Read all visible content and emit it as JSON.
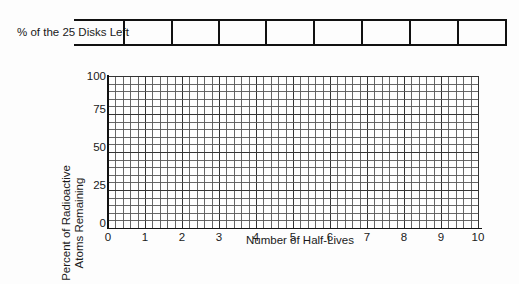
{
  "table": {
    "row_label": "% of the 25 Disks Left",
    "cells": [
      "",
      "",
      "",
      "",
      "",
      "",
      "",
      ""
    ]
  },
  "chart_data": {
    "type": "line",
    "title": "",
    "xlabel": "Number of Half-Lives",
    "ylabel": "Percent of Radioactive Atoms Remaining",
    "ylabel_lines": [
      "Percent of Radioactive",
      "Atoms Remaining"
    ],
    "x_ticks": [
      "0",
      "1",
      "2",
      "3",
      "4",
      "5",
      "6",
      "7",
      "8",
      "9",
      "10"
    ],
    "y_ticks": [
      "0",
      "25",
      "50",
      "75",
      "100"
    ],
    "xlim": [
      0,
      10
    ],
    "ylim": [
      0,
      100
    ],
    "grid": true,
    "x_minor_per_major": 5,
    "y_minor_step": 5,
    "series": [],
    "legend": null
  },
  "colors": {
    "line": "#111111",
    "grid_major": "#333333",
    "grid_minor": "#555555",
    "background": "#fdfdfd"
  }
}
